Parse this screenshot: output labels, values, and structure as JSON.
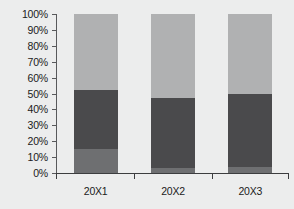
{
  "chart_data": {
    "type": "bar",
    "subtype": "stacked-100-percent",
    "title": "",
    "xlabel": "",
    "ylabel": "",
    "categories": [
      "20X1",
      "20X2",
      "20X3"
    ],
    "ylim": [
      0,
      100
    ],
    "y_tick_labels": [
      "0%",
      "10%",
      "20%",
      "30%",
      "40%",
      "50%",
      "60%",
      "70%",
      "80%",
      "90%",
      "100%"
    ],
    "y_tick_values": [
      0,
      10,
      20,
      30,
      40,
      50,
      60,
      70,
      80,
      90,
      100
    ],
    "grid": false,
    "legend": "none",
    "series": [
      {
        "name": "bottom-segment",
        "color": "#6e6f71",
        "values": [
          15,
          3,
          4
        ]
      },
      {
        "name": "middle-segment",
        "color": "#4a4a4c",
        "values": [
          37,
          44,
          46
        ]
      },
      {
        "name": "top-segment",
        "color": "#b0b1b2",
        "values": [
          48,
          53,
          50
        ]
      }
    ]
  },
  "style": {
    "background": "#eceded",
    "axis_color": "#3c3d3f",
    "tick_text_color": "#1b1b1b"
  }
}
